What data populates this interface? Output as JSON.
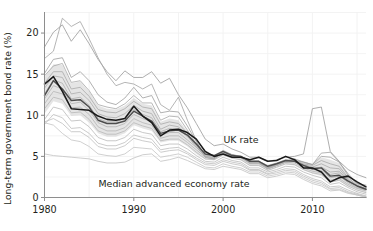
{
  "chart_data": {
    "type": "line",
    "title": "",
    "subtitle": "",
    "xlabel": "",
    "ylabel": "Long-term government bond rate (%)",
    "xlim": [
      1980,
      2016
    ],
    "ylim": [
      0,
      22.5
    ],
    "xticks": [
      1980,
      1990,
      2000,
      2010
    ],
    "xticklabels": [
      "1980",
      "1990",
      "2000",
      "2010"
    ],
    "yticks": [
      0,
      5,
      10,
      15,
      20
    ],
    "yticklabels": [
      "0",
      "5",
      "10",
      "15",
      "20"
    ],
    "grid": true,
    "legend_position": "inline-annotations",
    "annotations": [
      {
        "text": "UK rate",
        "x": 2002.0,
        "y": 6.6
      },
      {
        "text": "Median advanced economy rate",
        "x": 1994.5,
        "y": 1.3
      }
    ],
    "x": [
      1980,
      1981,
      1982,
      1983,
      1984,
      1985,
      1986,
      1987,
      1988,
      1989,
      1990,
      1991,
      1992,
      1993,
      1994,
      1995,
      1996,
      1997,
      1998,
      1999,
      2000,
      2001,
      2002,
      2003,
      2004,
      2005,
      2006,
      2007,
      2008,
      2009,
      2010,
      2011,
      2012,
      2013,
      2014,
      2015,
      2016
    ],
    "series": [
      {
        "name": "UK rate",
        "role": "highlight",
        "color": "#1a1a1a",
        "values": [
          13.8,
          14.7,
          12.9,
          10.8,
          10.7,
          10.6,
          9.9,
          9.5,
          9.4,
          9.6,
          11.1,
          9.9,
          9.1,
          7.5,
          8.2,
          8.3,
          7.9,
          7.1,
          5.6,
          5.0,
          5.3,
          4.9,
          4.9,
          4.6,
          4.9,
          4.4,
          4.5,
          5.0,
          4.6,
          3.6,
          3.6,
          3.1,
          1.9,
          2.4,
          2.6,
          1.9,
          1.3
        ]
      },
      {
        "name": "Median advanced economy rate",
        "role": "median",
        "color": "#4d4d4d",
        "values": [
          12.4,
          14.2,
          13.2,
          11.8,
          11.9,
          11.0,
          9.4,
          9.0,
          9.0,
          9.3,
          10.5,
          9.9,
          9.3,
          7.8,
          8.1,
          8.2,
          7.6,
          6.5,
          5.3,
          5.1,
          5.6,
          5.1,
          5.0,
          4.4,
          4.4,
          3.8,
          4.1,
          4.5,
          4.4,
          3.9,
          3.5,
          3.6,
          2.6,
          2.7,
          2.0,
          1.4,
          1.0
        ]
      },
      {
        "name": "country-1",
        "role": "background",
        "color": "#9a9a9a",
        "values": [
          18.3,
          20.1,
          21.0,
          19.0,
          20.4,
          18.7,
          16.8,
          15.3,
          14.2,
          15.4,
          14.6,
          14.6,
          15.3,
          13.9,
          14.5,
          12.5,
          10.9,
          9.0,
          7.1,
          6.3,
          6.5,
          5.9,
          5.5,
          4.9,
          4.9,
          4.4,
          4.6,
          4.9,
          5.0,
          5.3,
          10.8,
          11.0,
          5.6,
          4.4,
          3.4,
          2.8,
          2.4
        ]
      },
      {
        "name": "country-2",
        "role": "background",
        "color": "#a3a3a3",
        "values": [
          16.9,
          17.8,
          21.8,
          20.8,
          21.4,
          19.3,
          17.0,
          15.0,
          13.6,
          14.0,
          13.8,
          13.2,
          13.8,
          11.3,
          10.6,
          12.2,
          9.4,
          6.9,
          4.9,
          4.7,
          5.6,
          5.2,
          5.0,
          4.3,
          4.3,
          3.6,
          4.1,
          4.4,
          4.7,
          4.3,
          4.0,
          5.4,
          5.5,
          4.3,
          2.9,
          1.7,
          1.5
        ]
      },
      {
        "name": "country-3",
        "role": "background",
        "color": "#9e9e9e",
        "values": [
          15.1,
          16.8,
          17.0,
          14.6,
          15.3,
          14.2,
          12.5,
          11.6,
          11.3,
          12.1,
          13.4,
          12.1,
          12.4,
          10.3,
          10.5,
          10.4,
          8.7,
          6.8,
          4.9,
          4.7,
          5.6,
          5.2,
          4.9,
          4.2,
          4.3,
          3.6,
          4.0,
          4.5,
          4.5,
          4.3,
          4.0,
          5.0,
          4.9,
          4.3,
          2.7,
          1.7,
          1.3
        ]
      },
      {
        "name": "country-4",
        "role": "background",
        "color": "#a8a8a8",
        "values": [
          14.8,
          16.0,
          16.3,
          14.0,
          14.2,
          13.0,
          11.3,
          11.0,
          10.8,
          11.4,
          12.4,
          11.5,
          11.5,
          9.4,
          9.9,
          9.8,
          8.2,
          6.5,
          4.9,
          4.7,
          5.5,
          5.1,
          4.9,
          4.2,
          4.2,
          3.5,
          3.9,
          4.3,
          4.5,
          4.1,
          3.9,
          4.5,
          4.1,
          3.8,
          2.4,
          1.5,
          1.1
        ]
      },
      {
        "name": "country-5",
        "role": "background",
        "color": "#aaaaaa",
        "values": [
          13.9,
          15.3,
          15.3,
          13.2,
          13.4,
          12.3,
          10.7,
          10.4,
          10.3,
          10.8,
          11.7,
          11.0,
          10.8,
          8.9,
          9.2,
          9.0,
          7.8,
          6.3,
          5.0,
          4.8,
          5.5,
          5.1,
          4.9,
          4.2,
          4.2,
          3.5,
          3.9,
          4.3,
          4.4,
          4.0,
          3.7,
          4.1,
          3.6,
          3.5,
          2.2,
          1.4,
          1.0
        ]
      },
      {
        "name": "country-6",
        "role": "background",
        "color": "#adadad",
        "values": [
          13.3,
          14.8,
          14.6,
          12.6,
          12.8,
          11.8,
          10.2,
          9.8,
          9.7,
          10.2,
          11.2,
          10.5,
          10.2,
          8.3,
          8.8,
          8.6,
          7.5,
          6.1,
          5.0,
          4.9,
          5.5,
          5.0,
          4.9,
          4.2,
          4.2,
          3.5,
          3.9,
          4.3,
          4.4,
          3.9,
          3.5,
          3.7,
          3.1,
          3.2,
          2.1,
          1.4,
          1.0
        ]
      },
      {
        "name": "country-7",
        "role": "background",
        "color": "#b0b0b0",
        "values": [
          12.6,
          14.3,
          13.9,
          12.0,
          12.2,
          11.2,
          9.6,
          9.2,
          9.2,
          9.6,
          10.7,
          10.1,
          9.7,
          8.0,
          8.4,
          8.3,
          7.4,
          6.4,
          5.2,
          5.1,
          5.7,
          5.2,
          5.0,
          4.4,
          4.4,
          3.9,
          4.2,
          4.6,
          4.5,
          4.0,
          3.6,
          3.6,
          2.8,
          3.0,
          2.0,
          1.4,
          1.0
        ]
      },
      {
        "name": "country-8",
        "role": "background",
        "color": "#b3b3b3",
        "values": [
          12.0,
          13.6,
          13.2,
          11.4,
          11.6,
          10.6,
          9.1,
          8.6,
          8.6,
          9.0,
          10.1,
          9.6,
          9.2,
          7.6,
          7.9,
          7.9,
          7.0,
          6.1,
          5.1,
          5.0,
          5.6,
          5.1,
          4.9,
          4.3,
          4.3,
          3.7,
          4.1,
          4.5,
          4.4,
          3.8,
          3.4,
          3.3,
          2.4,
          2.6,
          1.8,
          1.2,
          0.9
        ]
      },
      {
        "name": "country-9",
        "role": "background",
        "color": "#b5b5b5",
        "values": [
          11.4,
          12.9,
          12.6,
          10.9,
          11.0,
          10.1,
          8.6,
          8.1,
          8.1,
          8.5,
          9.6,
          9.1,
          8.8,
          7.2,
          7.5,
          7.5,
          6.7,
          5.8,
          4.9,
          4.8,
          5.4,
          5.0,
          4.8,
          4.1,
          4.1,
          3.5,
          3.9,
          4.3,
          4.2,
          3.6,
          3.2,
          3.0,
          2.1,
          2.3,
          1.6,
          1.1,
          0.8
        ]
      },
      {
        "name": "country-10",
        "role": "background",
        "color": "#b8b8b8",
        "values": [
          10.8,
          12.2,
          11.9,
          10.3,
          10.4,
          9.5,
          8.1,
          7.7,
          7.7,
          8.1,
          9.1,
          8.7,
          8.4,
          6.9,
          7.1,
          7.1,
          6.4,
          5.5,
          4.7,
          4.6,
          5.2,
          4.8,
          4.6,
          3.9,
          3.9,
          3.3,
          3.7,
          4.1,
          4.0,
          3.4,
          3.0,
          2.8,
          1.9,
          2.1,
          1.4,
          0.9,
          0.6
        ]
      },
      {
        "name": "country-11",
        "role": "background",
        "color": "#bbbbbb",
        "values": [
          9.5,
          11.0,
          10.7,
          9.3,
          9.4,
          8.6,
          7.3,
          6.9,
          6.9,
          7.3,
          8.3,
          7.9,
          7.7,
          6.3,
          6.5,
          6.5,
          5.9,
          5.1,
          4.4,
          4.3,
          4.9,
          4.5,
          4.3,
          3.6,
          3.6,
          3.1,
          3.4,
          3.8,
          3.7,
          3.1,
          2.7,
          2.4,
          1.6,
          1.8,
          1.2,
          0.7,
          0.4
        ]
      },
      {
        "name": "country-12",
        "role": "background",
        "color": "#bebebe",
        "values": [
          8.9,
          10.1,
          9.7,
          8.4,
          8.5,
          7.8,
          6.6,
          6.3,
          6.3,
          6.7,
          7.6,
          7.3,
          7.1,
          5.8,
          6.0,
          6.1,
          5.5,
          4.8,
          4.2,
          4.1,
          4.6,
          4.3,
          4.1,
          3.4,
          3.4,
          2.9,
          3.2,
          3.5,
          3.4,
          2.8,
          2.3,
          2.0,
          1.3,
          1.4,
          0.9,
          0.5,
          0.2
        ]
      },
      {
        "name": "country-13",
        "role": "background",
        "color": "#c0c0c0",
        "values": [
          9.2,
          9.6,
          9.0,
          8.0,
          8.0,
          7.3,
          6.2,
          5.9,
          5.9,
          6.3,
          7.2,
          6.9,
          6.7,
          5.5,
          5.7,
          5.8,
          5.3,
          4.6,
          4.0,
          3.9,
          4.4,
          4.1,
          3.9,
          3.3,
          3.3,
          2.8,
          3.0,
          3.3,
          3.2,
          2.6,
          2.1,
          1.8,
          1.1,
          1.2,
          0.7,
          0.4,
          0.1
        ]
      },
      {
        "name": "country-14",
        "role": "background",
        "color": "#c2c2c2",
        "values": [
          5.3,
          5.1,
          5.0,
          4.9,
          4.8,
          4.7,
          4.4,
          4.2,
          4.2,
          4.3,
          4.8,
          5.2,
          5.3,
          4.4,
          4.6,
          4.9,
          4.5,
          4.0,
          3.5,
          3.4,
          3.8,
          3.6,
          3.4,
          2.9,
          2.9,
          2.4,
          2.6,
          2.9,
          2.8,
          2.2,
          1.7,
          1.4,
          0.8,
          0.9,
          0.5,
          0.3,
          0.0
        ]
      },
      {
        "name": "country-15",
        "role": "background",
        "color": "#c4c4c4",
        "values": [
          9.1,
          8.8,
          7.8,
          7.0,
          6.8,
          6.2,
          5.3,
          5.1,
          5.0,
          5.3,
          6.1,
          6.0,
          5.9,
          4.9,
          5.1,
          5.3,
          4.9,
          4.3,
          3.7,
          3.6,
          4.1,
          3.8,
          3.6,
          3.1,
          3.1,
          2.6,
          2.8,
          3.1,
          3.0,
          2.4,
          1.9,
          1.6,
          1.0,
          1.0,
          0.6,
          0.3,
          0.1
        ]
      }
    ],
    "band": {
      "name": "interquartile-band",
      "color": "#d0d0d0",
      "opacity": 0.55,
      "upper": [
        14.6,
        16.2,
        16.1,
        13.9,
        14.1,
        12.9,
        11.2,
        10.8,
        10.7,
        11.2,
        12.1,
        11.4,
        11.2,
        9.2,
        9.6,
        9.4,
        8.1,
        6.6,
        5.3,
        5.1,
        5.8,
        5.3,
        5.1,
        4.5,
        4.5,
        3.9,
        4.2,
        4.6,
        4.7,
        4.4,
        4.1,
        4.9,
        4.6,
        4.2,
        2.8,
        1.8,
        1.5
      ],
      "lower": [
        10.2,
        11.7,
        11.4,
        9.9,
        10.0,
        9.1,
        7.8,
        7.4,
        7.4,
        7.8,
        8.8,
        8.4,
        8.1,
        6.7,
        6.9,
        6.9,
        6.2,
        5.3,
        4.6,
        4.5,
        5.1,
        4.7,
        4.5,
        3.8,
        3.8,
        3.2,
        3.6,
        4.0,
        3.9,
        3.3,
        2.9,
        2.6,
        1.8,
        2.0,
        1.3,
        0.9,
        0.5
      ]
    }
  }
}
